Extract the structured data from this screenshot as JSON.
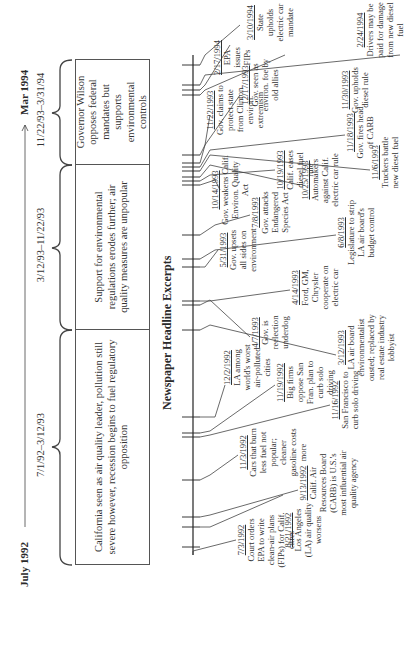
{
  "figure": {
    "start_label": "July 1992",
    "end_label": "Mar 1994",
    "section_title": "Newspaper Headline Excerpts"
  },
  "periods": [
    {
      "range": "7/1/92–3/12/93",
      "description": "California seen as air quality leader, pollution still severe however, recession begins to fuel regulatory opposition"
    },
    {
      "range": "3/12/93–11/22/93",
      "description": "Support for environmental regulations erodes further; air quality measures are unpopular"
    },
    {
      "range": "11/22/93–3/31/94",
      "description": "Governor Wilson opposes federal mandates but supports environmental controls"
    }
  ],
  "headlines": [
    {
      "date": "7/3/1992",
      "text": "Court orders EPA to write clean-air plans (FIPs) for Calif. cities"
    },
    {
      "date": "8/21/1992",
      "text": "Los Angeles (LA) air quality worsens"
    },
    {
      "date": "9/13/1992",
      "text": "Calif. Air Resources Board (CARB) is U.S.'s most influential air quality agency"
    },
    {
      "date": "11/3/1992",
      "text": "Cars that burn less fuel not popular; cleaner gasoline costs more"
    },
    {
      "date": "11/16/1992",
      "text": "San Francisco to curb solo driving"
    },
    {
      "date": "11/19/1992",
      "text": "Big firms oppose San Fran. plan to curb solo driving"
    },
    {
      "date": "12/2/1992",
      "text": "LA among world's worst air-polluted cities"
    },
    {
      "date": "3/12/1993",
      "text": "LA air board environmentalist ousted; replaced by real estate industry lobbyist"
    },
    {
      "date": "4/7/1993",
      "text": "Gov. is reelection underdog"
    },
    {
      "date": "4/14/1993",
      "text": "Ford, GM, Chrysler cooperate on electric car"
    },
    {
      "date": "5/31/1993",
      "text": "Gov. upsets all sides on environment"
    },
    {
      "date": "6/8/1993",
      "text": "Legislature to strip LA air board's budget control"
    },
    {
      "date": "7/8/1993",
      "text": "Gov. attacks Endangered Species Act"
    },
    {
      "date": "10/14/1993",
      "text": "Gov. weakens Calif. Environ. Quality Act"
    },
    {
      "date": "10/19/1993",
      "text": "Calif. eases diesel fuel rule"
    },
    {
      "date": "10/25/1993",
      "text": "Automakers against Calif. electric car rule"
    },
    {
      "date": "11/6/1993",
      "text": "Truckers battle new diesel fuel"
    },
    {
      "date": "11/18/1993",
      "text": "Gov. fires head of CARB"
    },
    {
      "date": "11/22/1993",
      "text": "Gov. claims to protect state from Clinton environ. extremism"
    },
    {
      "date": "11/30/1993",
      "text": "Gov. upholds diesel rule"
    },
    {
      "date": "12/17/1993",
      "text": "Gov. seen as environ. foe by old allies"
    },
    {
      "date": "2/17/1994",
      "text": "EPA issues FIPs"
    },
    {
      "date": "2/24/1994",
      "text": "Drivers may be paid for damage from new diesel fuel"
    },
    {
      "date": "3/10/1994",
      "text": "State upholds electric car mandate"
    }
  ]
}
